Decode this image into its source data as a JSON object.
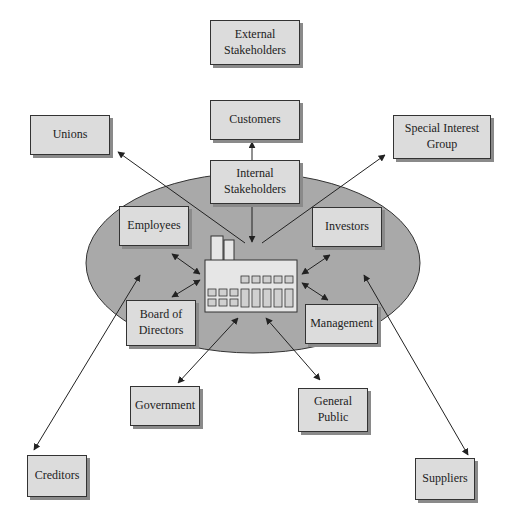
{
  "diagram": {
    "colors": {
      "ellipse": "#a9a9a9",
      "box": "#dcdcdc",
      "line": "#222222"
    },
    "center": {
      "label": "",
      "icon": "factory-icon"
    },
    "boxes": [
      {
        "id": "external",
        "label_lines": [
          "External",
          "Stakeholders"
        ],
        "x": 210,
        "y": 20,
        "w": 90,
        "h": 45
      },
      {
        "id": "customers",
        "label_lines": [
          "Customers"
        ],
        "x": 210,
        "y": 100,
        "w": 90,
        "h": 40
      },
      {
        "id": "unions",
        "label_lines": [
          "Unions"
        ],
        "x": 30,
        "y": 115,
        "w": 80,
        "h": 40
      },
      {
        "id": "special",
        "label_lines": [
          "Special Interest",
          "Group"
        ],
        "x": 393,
        "y": 115,
        "w": 98,
        "h": 44
      },
      {
        "id": "internal",
        "label_lines": [
          "Internal",
          "Stakeholders"
        ],
        "x": 210,
        "y": 160,
        "w": 90,
        "h": 44
      },
      {
        "id": "employees",
        "label_lines": [
          "Employees"
        ],
        "x": 119,
        "y": 206,
        "w": 70,
        "h": 40
      },
      {
        "id": "investors",
        "label_lines": [
          "Investors"
        ],
        "x": 312,
        "y": 207,
        "w": 70,
        "h": 40
      },
      {
        "id": "board",
        "label_lines": [
          "Board of",
          "Directors"
        ],
        "x": 126,
        "y": 300,
        "w": 70,
        "h": 46
      },
      {
        "id": "management",
        "label_lines": [
          "Management"
        ],
        "x": 305,
        "y": 304,
        "w": 73,
        "h": 40
      },
      {
        "id": "government",
        "label_lines": [
          "Government"
        ],
        "x": 130,
        "y": 386,
        "w": 70,
        "h": 40
      },
      {
        "id": "public",
        "label_lines": [
          "General",
          "Public"
        ],
        "x": 298,
        "y": 388,
        "w": 70,
        "h": 44
      },
      {
        "id": "creditors",
        "label_lines": [
          "Creditors"
        ],
        "x": 27,
        "y": 455,
        "w": 60,
        "h": 42
      },
      {
        "id": "suppliers",
        "label_lines": [
          "Suppliers"
        ],
        "x": 415,
        "y": 458,
        "w": 60,
        "h": 42
      }
    ],
    "arrows": [
      {
        "from": "internal",
        "to": "customers",
        "x1": 252,
        "y1": 160,
        "x2": 252,
        "y2": 142,
        "type": "single"
      },
      {
        "from": "internal",
        "to": "factory",
        "x1": 252,
        "y1": 206,
        "x2": 252,
        "y2": 242,
        "type": "single"
      },
      {
        "from": "factory",
        "to": "unions",
        "x1": 245,
        "y1": 243,
        "x2": 118,
        "y2": 152,
        "type": "single"
      },
      {
        "from": "factory",
        "to": "special",
        "x1": 262,
        "y1": 243,
        "x2": 385,
        "y2": 155,
        "type": "single"
      },
      {
        "from": "employees",
        "to": "factory",
        "x1": 172,
        "y1": 254,
        "x2": 200,
        "y2": 274,
        "type": "double"
      },
      {
        "from": "board",
        "to": "factory",
        "x1": 172,
        "y1": 297,
        "x2": 200,
        "y2": 280,
        "type": "double"
      },
      {
        "from": "investors",
        "to": "factory",
        "x1": 330,
        "y1": 255,
        "x2": 302,
        "y2": 274,
        "type": "double"
      },
      {
        "from": "management",
        "to": "factory",
        "x1": 328,
        "y1": 300,
        "x2": 302,
        "y2": 283,
        "type": "double"
      },
      {
        "from": "government",
        "to": "factory",
        "x1": 178,
        "y1": 383,
        "x2": 238,
        "y2": 318,
        "type": "double"
      },
      {
        "from": "public",
        "to": "factory",
        "x1": 320,
        "y1": 380,
        "x2": 266,
        "y2": 318,
        "type": "double"
      },
      {
        "from": "creditors",
        "to": "ellipse",
        "x1": 34,
        "y1": 450,
        "x2": 140,
        "y2": 275,
        "type": "double"
      },
      {
        "from": "suppliers",
        "to": "ellipse",
        "x1": 468,
        "y1": 455,
        "x2": 364,
        "y2": 275,
        "type": "double"
      }
    ],
    "ellipse": {
      "cx": 253,
      "cy": 263,
      "rx": 167,
      "ry": 90
    }
  }
}
